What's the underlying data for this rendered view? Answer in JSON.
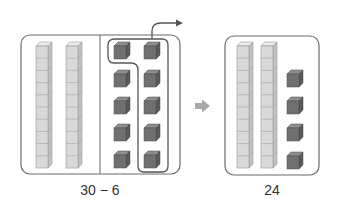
{
  "figure": {
    "left_panel": {
      "label": "30 − 6",
      "tens_rods": 2,
      "ones_cubes": 10,
      "ones_columns": 2,
      "circled_cubes": 6,
      "has_divider": true,
      "has_take_away_arrow": true
    },
    "transition_arrow": "right-arrow-icon",
    "right_panel": {
      "label": "24",
      "tens_rods": 2,
      "ones_cubes": 4
    },
    "colors": {
      "outline": "#6b6b6b",
      "rod_front": "#d9d9d9",
      "rod_top": "#eeeeee",
      "rod_side": "#c2c2c2",
      "rod_line": "#9a9a9a",
      "cube_front": "#727272",
      "cube_top": "#8e8e8e",
      "cube_side": "#5a5a5a",
      "arrow_gray": "#a8a8a8",
      "loop_line": "#555555"
    }
  }
}
